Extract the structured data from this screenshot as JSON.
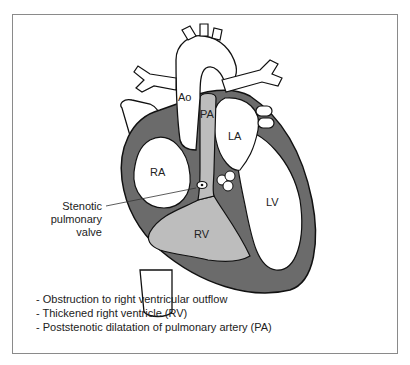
{
  "diagram": {
    "labels": {
      "ao": "Ao",
      "pa": "PA",
      "la": "LA",
      "ra": "RA",
      "lv": "LV",
      "rv": "RV"
    },
    "callout": {
      "line1": "Stenotic",
      "line2": "pulmonary",
      "line3": "valve"
    },
    "notes": [
      "-  Obstruction to right ventricular outflow",
      "-  Thickened right ventricle (RV)",
      "-  Poststenotic dilatation of pulmonary artery (PA)"
    ],
    "colors": {
      "myocardium": "#6b6b6b",
      "pulmonary_flow": "#bdbdbd",
      "outline": "#111111",
      "frame": "#8a8a8a"
    }
  }
}
